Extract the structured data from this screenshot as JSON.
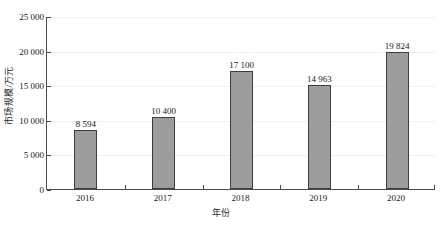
{
  "chart_data": {
    "type": "bar",
    "title": "",
    "xlabel": "年份",
    "ylabel": "市场规模/万元",
    "categories": [
      "2016",
      "2017",
      "2018",
      "2019",
      "2020"
    ],
    "values": [
      8594,
      10400,
      17100,
      14963,
      19824
    ],
    "value_labels": [
      "8 594",
      "10 400",
      "17 100",
      "14 963",
      "19 824"
    ],
    "ylim": [
      0,
      25000
    ],
    "ytick_values": [
      0,
      5000,
      10000,
      15000,
      20000,
      25000
    ],
    "ytick_labels": [
      "0",
      "5 000",
      "10 000",
      "15 000",
      "20 000",
      "25 000"
    ],
    "grid": true,
    "legend": null,
    "series": [
      {
        "name": "市场规模",
        "values": [
          8594,
          10400,
          17100,
          14963,
          19824
        ]
      }
    ],
    "colors": {
      "bar_fill": "#9d9d9d",
      "bar_border": "#3d3d3d",
      "axis": "#4a4a4a",
      "gridline": "#f0f0f0",
      "text": "#1a1a1a",
      "background": "#ffffff"
    }
  }
}
